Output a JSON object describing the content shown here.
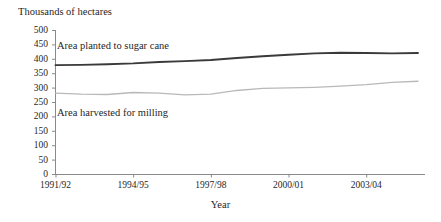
{
  "chart_data": {
    "type": "line",
    "title": "",
    "ylabel": "Thousands of hectares",
    "xlabel": "Year",
    "ylim": [
      0,
      500
    ],
    "yticks": [
      0,
      50,
      100,
      150,
      200,
      250,
      300,
      350,
      400,
      450,
      500
    ],
    "ytick_labels": [
      "0",
      "50",
      "100",
      "150",
      "200",
      "250",
      "300",
      "350",
      "400",
      "450",
      "500"
    ],
    "grid": false,
    "legend_position": "inline-annotations",
    "x": [
      "1991/92",
      "1992/93",
      "1993/94",
      "1994/95",
      "1995/96",
      "1996/97",
      "1997/98",
      "1998/99",
      "1999/00",
      "2000/01",
      "2001/02",
      "2002/03",
      "2003/04",
      "2004/05",
      "2005/06"
    ],
    "xtick_labels": [
      "1991/92",
      "1994/95",
      "1997/98",
      "2000/01",
      "2003/04"
    ],
    "xticks_shown": [
      0,
      3,
      6,
      9,
      12
    ],
    "series": [
      {
        "name": "Area planted to sugar cane",
        "color": "#3a3a3a",
        "values": [
          378,
          379,
          381,
          384,
          389,
          392,
          396,
          403,
          409,
          414,
          419,
          421,
          420,
          419,
          420
        ]
      },
      {
        "name": "Area harvested for milling",
        "color": "#b9b9b9",
        "values": [
          281,
          277,
          276,
          283,
          281,
          275,
          277,
          290,
          297,
          299,
          301,
          305,
          310,
          318,
          322
        ]
      }
    ],
    "annotations": [
      {
        "text": "Area planted to sugar cane",
        "series": "Area planted to sugar cane"
      },
      {
        "text": "Area harvested for milling",
        "series": "Area harvested for milling"
      }
    ]
  },
  "axes": {
    "y_axis_title": "Thousands of hectares",
    "x_axis_title": "Year"
  }
}
